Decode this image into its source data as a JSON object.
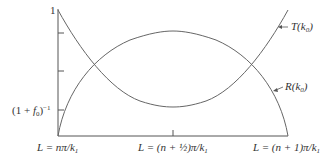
{
  "diagram": {
    "y_axis": {
      "top_label": "1",
      "tick_label": "(1 + f0)^-1",
      "tick_label_parts": {
        "open": "(1 + ",
        "f": "f",
        "sub": "0",
        "close": ")",
        "sup": "−1"
      }
    },
    "x_axis": {
      "labels": [
        {
          "text": "L = nπ/k1",
          "prefix": "L = nπ/k",
          "sub": "1"
        },
        {
          "text": "L = (n + ½)π/k1",
          "prefix": "L = (n + ½)π/k",
          "sub": "1"
        },
        {
          "text": "L = (n + 1)π/k1",
          "prefix": "L = (n + 1)π/k",
          "sub": "1"
        }
      ]
    },
    "curves": [
      {
        "name": "T(k0)",
        "label_prefix": "T(k",
        "label_sub": "0",
        "label_suffix": ")",
        "color": "#555555"
      },
      {
        "name": "R(k0)",
        "label_prefix": "R(k",
        "label_sub": "0",
        "label_suffix": ")",
        "color": "#555555"
      }
    ],
    "colors": {
      "axis": "#555555",
      "curve": "#666666",
      "text": "#333333"
    }
  }
}
